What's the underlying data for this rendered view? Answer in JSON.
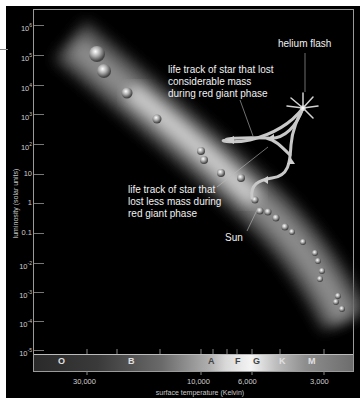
{
  "figure": {
    "y_axis": {
      "label": "luminosity (solar units)",
      "ticks": [
        {
          "base": "10",
          "exp": "6",
          "y": 25
        },
        {
          "base": "10",
          "exp": "5",
          "y": 55
        },
        {
          "base": "10",
          "exp": "4",
          "y": 85
        },
        {
          "base": "10",
          "exp": "3",
          "y": 114
        },
        {
          "base": "10",
          "exp": "2",
          "y": 144
        },
        {
          "base": "10",
          "exp": "",
          "y": 174
        },
        {
          "base": "1",
          "exp": "",
          "y": 203
        },
        {
          "base": "0.1",
          "exp": "",
          "y": 233
        },
        {
          "base": "10",
          "exp": "-2",
          "y": 263
        },
        {
          "base": "10",
          "exp": "-3",
          "y": 292
        },
        {
          "base": "10",
          "exp": "-4",
          "y": 321
        },
        {
          "base": "10",
          "exp": "-5",
          "y": 350
        }
      ]
    },
    "x_axis": {
      "label": "surface temperature (Kelvin)",
      "ticks": [
        {
          "label": "30,000",
          "x": 87
        },
        {
          "label": "10,000",
          "x": 201
        },
        {
          "label": "6,000",
          "x": 252
        },
        {
          "label": "3,000",
          "x": 324
        }
      ]
    },
    "spectral_classes": [
      {
        "label": "O",
        "x": 62
      },
      {
        "label": "B",
        "x": 132
      },
      {
        "label": "A",
        "x": 212
      },
      {
        "label": "F",
        "x": 239
      },
      {
        "label": "G",
        "x": 257
      },
      {
        "label": "K",
        "x": 283
      },
      {
        "label": "M",
        "x": 312
      }
    ],
    "annotations": {
      "helium_flash": "helium flash",
      "considerable_mass": [
        "life track of star that lost",
        "considerable mass",
        "during red giant phase"
      ],
      "less_mass": [
        "life track of star that",
        "lost less mass during",
        "red giant phase"
      ],
      "sun": "Sun"
    }
  }
}
